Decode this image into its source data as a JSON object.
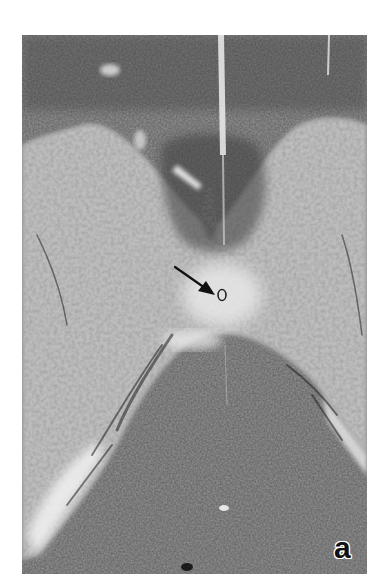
{
  "figure": {
    "panel_label": "a",
    "image_description": "grayscale micrograph",
    "annotations": [
      {
        "type": "arrow",
        "points_to": "ring-structure"
      }
    ],
    "colors": {
      "background": "#ffffff",
      "dark_tissue": "#4a4a4a",
      "light_tissue": "#c8c8c8",
      "arrow": "#111111",
      "label": "#111111"
    }
  }
}
